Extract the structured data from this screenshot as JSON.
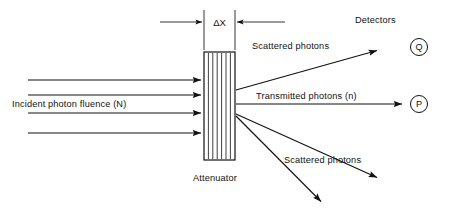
{
  "figure": {
    "background_color": "#ffffff",
    "line_color": "#111111"
  },
  "labels": {
    "incident": "Incident photon fluence (N)",
    "attenuator": "Attenuator",
    "thickness": "ΔX",
    "scattered_upper": "Scattered photons",
    "scattered_lower": "Scattered photons",
    "transmitted": "Transmitted photons (n)",
    "detectors": "Detectors",
    "detector_q": "Q",
    "detector_p": "P"
  },
  "diagram": {
    "attenuator": {
      "x": 204,
      "y": 52,
      "width": 31,
      "height": 108,
      "hatch_lines": 6
    },
    "incident_rays": [
      {
        "x1": 28,
        "y1": 80,
        "x2": 203,
        "y2": 80
      },
      {
        "x1": 28,
        "y1": 95,
        "x2": 203,
        "y2": 95
      },
      {
        "x1": 28,
        "y1": 113,
        "x2": 203,
        "y2": 113
      },
      {
        "x1": 28,
        "y1": 133,
        "x2": 203,
        "y2": 133
      }
    ],
    "transmitted_ray": {
      "x1": 236,
      "y1": 104,
      "x2": 404,
      "y2": 104
    },
    "scattered_rays": [
      {
        "x1": 236,
        "y1": 90,
        "x2": 379,
        "y2": 50
      },
      {
        "x1": 236,
        "y1": 114,
        "x2": 379,
        "y2": 179
      },
      {
        "x1": 236,
        "y1": 116,
        "x2": 323,
        "y2": 203
      }
    ],
    "dimension": {
      "left_extension_x": 204,
      "right_extension_x": 235,
      "extension_top_y": 10,
      "extension_bottom_y": 50,
      "arrow_y": 22,
      "left_arrow_tail_x": 160,
      "right_arrow_tail_x": 285
    },
    "detectors": [
      {
        "id": "Q",
        "cx": 419,
        "cy": 47,
        "r": 8.5
      },
      {
        "id": "P",
        "cx": 419,
        "cy": 104,
        "r": 8.5
      }
    ]
  }
}
